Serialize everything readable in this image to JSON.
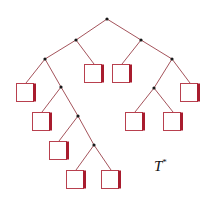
{
  "diagram": {
    "type": "binary-tree",
    "label": {
      "main": "T",
      "superscript": "*",
      "x": 154,
      "y": 157
    },
    "colors": {
      "edge": "#9a4048",
      "internal_node": "#1a1a1a",
      "leaf_outline": "#b8404e",
      "leaf_side": "#a81c2e"
    },
    "internal_nodes": [
      {
        "id": "n0",
        "x": 107,
        "y": 19
      },
      {
        "id": "n1",
        "x": 76,
        "y": 40
      },
      {
        "id": "n2",
        "x": 141,
        "y": 40
      },
      {
        "id": "n3",
        "x": 45,
        "y": 59
      },
      {
        "id": "n4",
        "x": 172,
        "y": 59
      },
      {
        "id": "n5",
        "x": 61,
        "y": 87
      },
      {
        "id": "n6",
        "x": 154,
        "y": 88
      },
      {
        "id": "n7",
        "x": 78,
        "y": 116
      },
      {
        "id": "n8",
        "x": 94,
        "y": 145
      }
    ],
    "leaves": [
      {
        "id": "l0",
        "x": 84,
        "y": 64,
        "w": 20,
        "h": 19
      },
      {
        "id": "l1",
        "x": 112,
        "y": 64,
        "w": 20,
        "h": 19
      },
      {
        "id": "l2",
        "x": 16,
        "y": 83,
        "w": 20,
        "h": 19
      },
      {
        "id": "l3",
        "x": 180,
        "y": 83,
        "w": 20,
        "h": 19
      },
      {
        "id": "l4",
        "x": 32,
        "y": 112,
        "w": 20,
        "h": 19
      },
      {
        "id": "l5",
        "x": 125,
        "y": 112,
        "w": 20,
        "h": 19
      },
      {
        "id": "l6",
        "x": 163,
        "y": 112,
        "w": 20,
        "h": 19
      },
      {
        "id": "l7",
        "x": 49,
        "y": 141,
        "w": 20,
        "h": 19
      },
      {
        "id": "l8",
        "x": 66,
        "y": 170,
        "w": 20,
        "h": 19
      },
      {
        "id": "l9",
        "x": 101,
        "y": 170,
        "w": 20,
        "h": 19
      }
    ],
    "edges": [
      [
        "n0",
        "n1"
      ],
      [
        "n0",
        "n2"
      ],
      [
        "n1",
        "n3"
      ],
      [
        "n1",
        "l0"
      ],
      [
        "n2",
        "l1"
      ],
      [
        "n2",
        "n4"
      ],
      [
        "n3",
        "l2"
      ],
      [
        "n3",
        "n5"
      ],
      [
        "n4",
        "n6"
      ],
      [
        "n4",
        "l3"
      ],
      [
        "n5",
        "l4"
      ],
      [
        "n5",
        "n7"
      ],
      [
        "n6",
        "l5"
      ],
      [
        "n6",
        "l6"
      ],
      [
        "n7",
        "l7"
      ],
      [
        "n7",
        "n8"
      ],
      [
        "n8",
        "l8"
      ],
      [
        "n8",
        "l9"
      ]
    ]
  }
}
